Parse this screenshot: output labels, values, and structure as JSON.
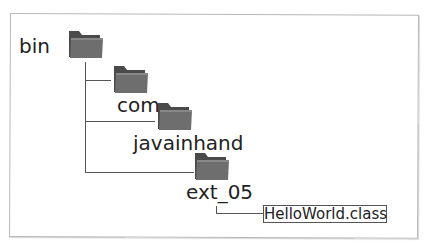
{
  "diagram": {
    "title": "",
    "nodes": [
      {
        "id": "bin",
        "label": "bin",
        "type": "folder"
      },
      {
        "id": "com",
        "label": "com",
        "type": "folder"
      },
      {
        "id": "javainhand",
        "label": "javainhand",
        "type": "folder"
      },
      {
        "id": "ext_05",
        "label": "ext_05",
        "type": "folder"
      },
      {
        "id": "helloworld",
        "label": "HelloWorld.class",
        "type": "file"
      }
    ],
    "edges": [
      {
        "from": "bin",
        "to": "com"
      },
      {
        "from": "bin",
        "to": "javainhand"
      },
      {
        "from": "bin",
        "to": "ext_05"
      },
      {
        "from": "ext_05",
        "to": "helloworld"
      }
    ],
    "colors": {
      "folder_front": "#6e6e6e",
      "folder_back": "#4a4a4a",
      "line": "#555555",
      "frame": "#b8b8b8"
    }
  }
}
